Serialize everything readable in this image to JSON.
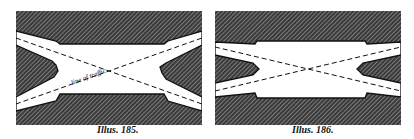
{
  "figures": [
    {
      "id": "185",
      "caption": "Illus. 185.",
      "annotation": "line of traffic",
      "description": "Road crossing with wide central junction; dashed traffic lines cross at centre"
    },
    {
      "id": "186",
      "caption": "Illus. 186.",
      "annotation": "",
      "description": "Road crossing with narrower central junction; dashed traffic lines cross twice near centre"
    }
  ],
  "colors": {
    "hatch_dark": "#2a2a2a",
    "hatch_light": "#ffffff",
    "road": "#ffffff",
    "ink": "#111111"
  }
}
